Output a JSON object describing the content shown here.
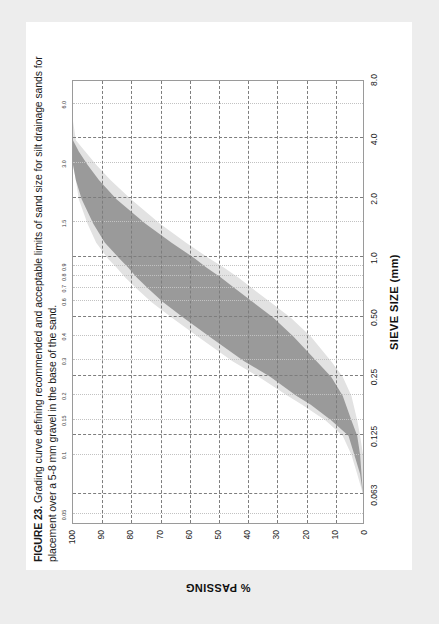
{
  "caption": {
    "figure_number": "FIGURE 23.",
    "text": " Grading curve defining recommended and acceptable limits of sand size for silt drainage sands for placement over a 5-8 mm gravel in the base of the sand."
  },
  "colors": {
    "page_background": "#ededed",
    "page": "#ffffff",
    "frame": "#9a9a9a",
    "gridline": "#7d7d7d",
    "minor_gridline": "#c2c2c2",
    "recommended_band": "#9a9a9a",
    "acceptable_band": "#e2e2e2",
    "text": "#1a1a1a"
  },
  "chart_data": {
    "type": "area",
    "title": "Grading curve defining recommended and acceptable limits of sand size for silt drainage sands",
    "xlabel": "SIEVE SIZE (mm)",
    "ylabel": "% PASSING",
    "xscale": "log",
    "xlim": [
      0.045,
      8.0
    ],
    "ylim": [
      0,
      100
    ],
    "grid": true,
    "legend_position": "none",
    "x_major_ticks": [
      "0.063",
      "0.125",
      "0.25",
      "0.50",
      "1.0",
      "2.0",
      "4.0",
      "8.0"
    ],
    "x_major_values": [
      0.063,
      0.125,
      0.25,
      0.5,
      1.0,
      2.0,
      4.0,
      8.0
    ],
    "x_minor_ticks": [
      "0.05",
      "0.1",
      "0.15",
      "0.2",
      "0.3",
      "0.4",
      "0.6",
      "0.7",
      "0.8",
      "0.9",
      "1.5",
      "3.0",
      "6.0"
    ],
    "x_minor_values": [
      0.05,
      0.1,
      0.15,
      0.2,
      0.3,
      0.4,
      0.6,
      0.7,
      0.8,
      0.9,
      1.5,
      3.0,
      6.0
    ],
    "y_ticks": [
      "0",
      "10",
      "20",
      "30",
      "40",
      "50",
      "60",
      "70",
      "80",
      "90",
      "100"
    ],
    "y_values": [
      0,
      10,
      20,
      30,
      40,
      50,
      60,
      70,
      80,
      90,
      100
    ],
    "series": [
      {
        "name": "Acceptable limits - upper (finer) boundary",
        "points": [
          [
            0.063,
            0
          ],
          [
            0.08,
            2
          ],
          [
            0.1,
            4
          ],
          [
            0.125,
            7
          ],
          [
            0.15,
            13
          ],
          [
            0.18,
            21
          ],
          [
            0.2,
            26
          ],
          [
            0.25,
            36
          ],
          [
            0.3,
            45
          ],
          [
            0.4,
            57
          ],
          [
            0.5,
            66
          ],
          [
            0.6,
            73
          ],
          [
            0.7,
            78
          ],
          [
            0.8,
            82
          ],
          [
            0.9,
            85
          ],
          [
            1.0,
            88
          ],
          [
            1.2,
            92
          ],
          [
            1.5,
            95
          ],
          [
            2.0,
            98
          ],
          [
            2.5,
            99
          ],
          [
            3.0,
            100
          ],
          [
            4.0,
            100
          ],
          [
            6.0,
            100
          ],
          [
            8.0,
            100
          ]
        ]
      },
      {
        "name": "Acceptable limits - lower (coarser) boundary",
        "points": [
          [
            0.063,
            0
          ],
          [
            0.1,
            0
          ],
          [
            0.125,
            1
          ],
          [
            0.15,
            2
          ],
          [
            0.2,
            4
          ],
          [
            0.25,
            7
          ],
          [
            0.3,
            11
          ],
          [
            0.4,
            18
          ],
          [
            0.5,
            25
          ],
          [
            0.6,
            32
          ],
          [
            0.7,
            38
          ],
          [
            0.8,
            43
          ],
          [
            0.9,
            48
          ],
          [
            1.0,
            53
          ],
          [
            1.2,
            61
          ],
          [
            1.5,
            70
          ],
          [
            2.0,
            80
          ],
          [
            2.5,
            87
          ],
          [
            3.0,
            92
          ],
          [
            4.0,
            99
          ],
          [
            5.0,
            100
          ],
          [
            6.0,
            100
          ],
          [
            8.0,
            100
          ]
        ]
      },
      {
        "name": "Recommended limits - upper (finer) boundary",
        "points": [
          [
            0.063,
            0
          ],
          [
            0.08,
            1
          ],
          [
            0.1,
            3
          ],
          [
            0.125,
            5
          ],
          [
            0.15,
            11
          ],
          [
            0.18,
            18
          ],
          [
            0.2,
            23
          ],
          [
            0.25,
            32
          ],
          [
            0.3,
            41
          ],
          [
            0.4,
            53
          ],
          [
            0.5,
            62
          ],
          [
            0.6,
            69
          ],
          [
            0.7,
            74
          ],
          [
            0.8,
            78
          ],
          [
            0.9,
            81
          ],
          [
            1.0,
            84
          ],
          [
            1.2,
            89
          ],
          [
            1.5,
            93
          ],
          [
            2.0,
            97
          ],
          [
            2.5,
            99
          ],
          [
            3.0,
            100
          ],
          [
            4.0,
            100
          ],
          [
            6.0,
            100
          ],
          [
            8.0,
            100
          ]
        ]
      },
      {
        "name": "Recommended limits - lower (coarser) boundary",
        "points": [
          [
            0.063,
            0
          ],
          [
            0.1,
            1
          ],
          [
            0.125,
            2
          ],
          [
            0.15,
            4
          ],
          [
            0.2,
            7
          ],
          [
            0.25,
            11
          ],
          [
            0.3,
            16
          ],
          [
            0.4,
            24
          ],
          [
            0.5,
            31
          ],
          [
            0.6,
            38
          ],
          [
            0.7,
            44
          ],
          [
            0.8,
            49
          ],
          [
            0.9,
            54
          ],
          [
            1.0,
            58
          ],
          [
            1.2,
            66
          ],
          [
            1.5,
            75
          ],
          [
            2.0,
            85
          ],
          [
            2.5,
            91
          ],
          [
            3.0,
            95
          ],
          [
            3.5,
            98
          ],
          [
            4.0,
            100
          ],
          [
            6.0,
            100
          ],
          [
            8.0,
            100
          ]
        ]
      }
    ]
  }
}
